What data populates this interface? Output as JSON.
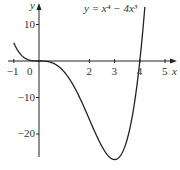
{
  "chart_data": {
    "type": "line",
    "title": "",
    "xlabel": "x",
    "ylabel": "y",
    "equation_label": "y = x⁴ − 4x³",
    "function": "x^4 - 4x^3",
    "xlim": [
      -1.1,
      5.3
    ],
    "ylim": [
      -27.5,
      15
    ],
    "x_ticks": [
      -1,
      0,
      2,
      3,
      4,
      5
    ],
    "x_tick_labels": [
      "−1",
      "0",
      "2",
      "3",
      "4",
      "5"
    ],
    "y_ticks": [
      10,
      -10,
      -20
    ],
    "y_tick_labels": [
      "10",
      "−10",
      "−20"
    ],
    "grid": false,
    "series": [
      {
        "name": "y = x^4 - 4x^3",
        "x": [
          -1,
          -0.5,
          0,
          0.5,
          1,
          1.5,
          2,
          2.5,
          3,
          3.5,
          4,
          4.2
        ],
        "y": [
          5,
          0.5625,
          0,
          -0.4375,
          -3,
          -8.4375,
          -16,
          -23.4375,
          -27,
          -21.4375,
          0,
          14.1
        ]
      }
    ],
    "color": "#222222"
  }
}
